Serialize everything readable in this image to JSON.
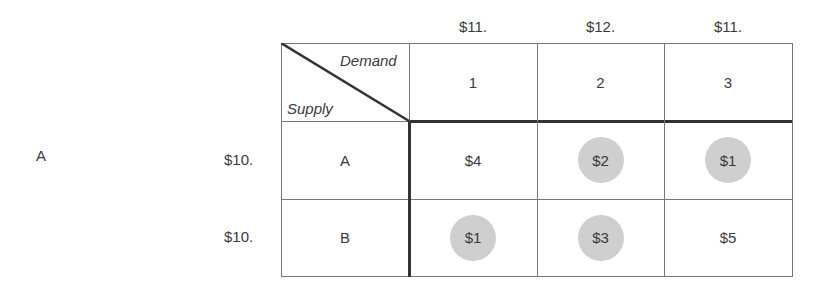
{
  "side_label": "A",
  "demand_prices": [
    "$11.",
    "$12.",
    "$11."
  ],
  "supply_prices": [
    "$10.",
    "$10."
  ],
  "corner": {
    "top": "Demand",
    "bottom": "Supply"
  },
  "columns": [
    "1",
    "2",
    "3"
  ],
  "rows": [
    {
      "label": "A",
      "cells": [
        {
          "value": "$4",
          "circled": false
        },
        {
          "value": "$2",
          "circled": true
        },
        {
          "value": "$1",
          "circled": true
        }
      ]
    },
    {
      "label": "B",
      "cells": [
        {
          "value": "$1",
          "circled": true
        },
        {
          "value": "$3",
          "circled": true
        },
        {
          "value": "$5",
          "circled": false
        }
      ]
    }
  ],
  "colors": {
    "circle": "#cfcfcf",
    "border": "#777777",
    "thick_border": "#333333"
  }
}
